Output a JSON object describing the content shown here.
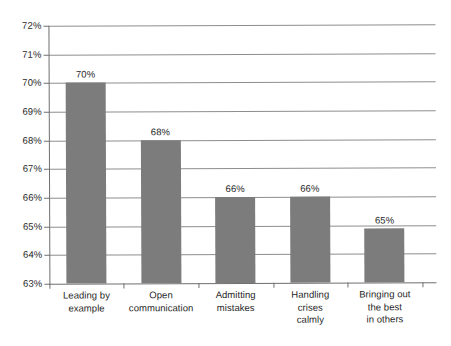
{
  "chart_data": {
    "type": "bar",
    "title": "",
    "xlabel": "",
    "ylabel": "",
    "categories": [
      "Leading by example",
      "Open communication",
      "Admitting mistakes",
      "Handling crises calmly",
      "Bringing out the best in others"
    ],
    "category_lines": [
      [
        "Leading by",
        "example"
      ],
      [
        "Open",
        "communication"
      ],
      [
        "Admitting",
        "mistakes"
      ],
      [
        "Handling",
        "crises",
        "calmly"
      ],
      [
        "Bringing out",
        "the best",
        "in others"
      ]
    ],
    "values": [
      70,
      68,
      66,
      66,
      64.9
    ],
    "data_labels": [
      "70%",
      "68%",
      "66%",
      "66%",
      "65%"
    ],
    "ylim": [
      63,
      72
    ],
    "ytick_step": 1,
    "ytick_labels": [
      "72%",
      "71%",
      "70%",
      "69%",
      "68%",
      "67%",
      "66%",
      "65%",
      "64%",
      "63%"
    ],
    "ytick_values": [
      72,
      71,
      70,
      69,
      68,
      67,
      66,
      65,
      64,
      63
    ],
    "grid": true,
    "legend": "none",
    "bar_color": "#7c7c7c",
    "grid_color": "#8e8e8e",
    "axis_color": "#6f6f6f",
    "background": "#ffffff",
    "value_unit": "%"
  }
}
